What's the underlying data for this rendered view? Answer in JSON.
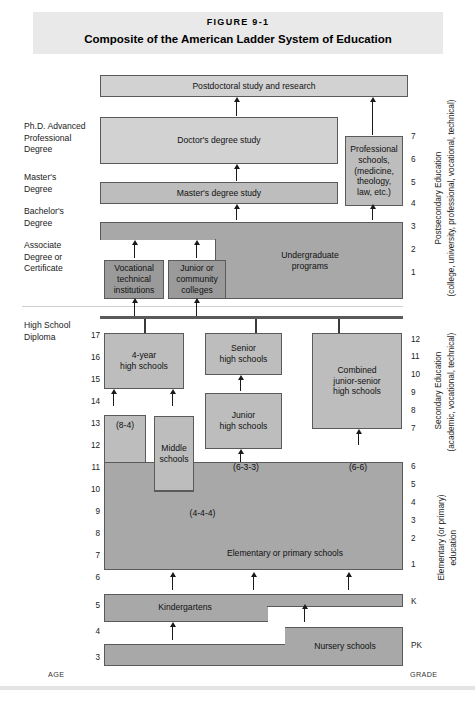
{
  "figure": {
    "number": "FIGURE 9-1",
    "title": "Composite of the American Ladder System of Education"
  },
  "axis_captions": {
    "left": "AGE",
    "right": "GRADE"
  },
  "left_labels": [
    {
      "text": "Ph.D. Advanced\nProfessional\nDegree"
    },
    {
      "text": "Master's\nDegree"
    },
    {
      "text": "Bachelor's\nDegree"
    },
    {
      "text": "Associate\nDegree or\nCertificate"
    },
    {
      "text": "High School\nDiploma"
    }
  ],
  "left_label_lines": {
    "phd": [
      "Ph.D. Advanced",
      "Professional",
      "Degree"
    ],
    "masters": [
      "Master's",
      "Degree"
    ],
    "bachelors": [
      "Bachelor's",
      "Degree"
    ],
    "associate": [
      "Associate",
      "Degree or",
      "Certificate"
    ],
    "hsdiploma": [
      "High School",
      "Diploma"
    ]
  },
  "right_captions": {
    "postsecondary": [
      "Postsecondary Education",
      "(college, university, professional, vocational, technical)"
    ],
    "secondary": [
      "Secondary Education",
      "(academic, vocational, technical)"
    ],
    "elementary": [
      "Elementary (or primary)",
      "education"
    ]
  },
  "boxes": {
    "postdoctoral": "Postdoctoral study and research",
    "doctors": "Doctor's degree study",
    "masters_study": "Master's degree study",
    "professional_schools": [
      "Professional",
      "schools,",
      "(medicine,",
      "theology,",
      "law, etc.)"
    ],
    "undergraduate": [
      "Undergraduate",
      "programs"
    ],
    "vocational": [
      "Vocational",
      "technical",
      "institutions"
    ],
    "junior_college": [
      "Junior or",
      "community",
      "colleges"
    ],
    "four_year_hs": [
      "4-year",
      "high schools"
    ],
    "senior_hs": [
      "Senior",
      "high schools"
    ],
    "junior_hs": [
      "Junior",
      "high schools"
    ],
    "combined_hs": [
      "Combined",
      "junior-senior",
      "high schools"
    ],
    "middle": [
      "Middle",
      "schools"
    ],
    "elementary": "Elementary or primary schools",
    "kindergartens": "Kindergartens",
    "nursery": "Nursery schools"
  },
  "pattern_labels": {
    "eight_four": "(8-4)",
    "four_four_four": "(4-4-4)",
    "six_three_three": "(6-3-3)",
    "six_six": "(6-6)"
  },
  "age_scale": [
    "17",
    "16",
    "15",
    "14",
    "13",
    "12",
    "11",
    "10",
    "9",
    "8",
    "7",
    "6",
    "5",
    "4",
    "3"
  ],
  "grade_scale_postsecondary": [
    "7",
    "6",
    "5",
    "4",
    "3",
    "2",
    "1"
  ],
  "grade_scale_secondary": [
    "12",
    "11",
    "10",
    "9",
    "8",
    "7"
  ],
  "grade_scale_elementary": [
    "6",
    "5",
    "4",
    "3",
    "2",
    "1"
  ],
  "grade_scale_early": [
    "K",
    "PK"
  ],
  "colors": {
    "banner": "#e9e9e9",
    "box_light": "#d2d2d2",
    "box_mid": "#bdbdbd",
    "box_dark": "#a8a8a8",
    "border": "#5a5a5a"
  }
}
